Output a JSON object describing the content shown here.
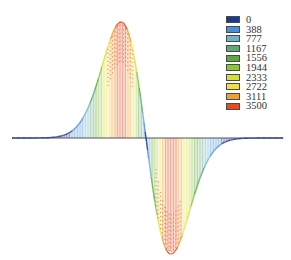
{
  "chart_data": {
    "type": "bar",
    "title": "",
    "xlabel": "",
    "ylabel": "",
    "grid": false,
    "legend_position": "top-right",
    "color_scale": {
      "levels": [
        0,
        388,
        777,
        1167,
        1556,
        1944,
        2333,
        2722,
        3111,
        3500
      ],
      "colors": [
        "#1a3a8c",
        "#4a8fd8",
        "#6fb5c8",
        "#5fa878",
        "#5fa83a",
        "#8cc43a",
        "#d4e03a",
        "#f0e040",
        "#f0a030",
        "#e84a1a"
      ]
    },
    "curve": {
      "x_range": [
        -3.5,
        3.5
      ],
      "peak": {
        "x": -0.7,
        "value": 3500
      },
      "trough": {
        "x": 0.7,
        "value": -3500
      },
      "zero_crossing_x": 0
    },
    "ylim": [
      -3500,
      3500
    ]
  },
  "legend": {
    "items": [
      {
        "label": "0",
        "color": "#1a3a8c"
      },
      {
        "label": "388",
        "color": "#4a8fd8"
      },
      {
        "label": "777",
        "color": "#6fb5c8"
      },
      {
        "label": "1167",
        "color": "#5fa878"
      },
      {
        "label": "1556",
        "color": "#5fa83a"
      },
      {
        "label": "1944",
        "color": "#8cc43a"
      },
      {
        "label": "2333",
        "color": "#d4e03a"
      },
      {
        "label": "2722",
        "color": "#f0e040"
      },
      {
        "label": "3111",
        "color": "#f0a030"
      },
      {
        "label": "3500",
        "color": "#e84a1a"
      }
    ]
  }
}
